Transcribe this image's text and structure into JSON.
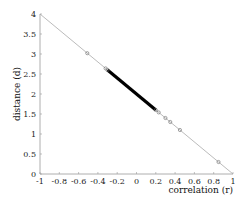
{
  "chart_data": {
    "type": "scatter",
    "title": "",
    "xlabel": "correlation (r)",
    "ylabel": "distance (d)",
    "xlim": [
      -1,
      1
    ],
    "ylim": [
      0,
      4
    ],
    "xticks": [
      "-1",
      "-0.8",
      "-0.6",
      "-0.4",
      "-0.2",
      "0",
      "0.2",
      "0.4",
      "0.6",
      "0.8",
      "1"
    ],
    "yticks": [
      "0",
      "0.5",
      "1",
      "1.5",
      "2",
      "2.5",
      "3",
      "3.5",
      "4"
    ],
    "grid": false,
    "reference_line": {
      "from": [
        -1,
        4
      ],
      "to": [
        1,
        0
      ],
      "color": "#aaaaaa"
    },
    "dense_segment": {
      "r_from": -0.3,
      "r_to": 0.2,
      "color": "#000000"
    },
    "points": [
      {
        "r": -0.51,
        "d": 3.02
      },
      {
        "r": -0.32,
        "d": 2.64
      },
      {
        "r": -0.3,
        "d": 2.6
      },
      {
        "r": 0.2,
        "d": 1.6
      },
      {
        "r": 0.23,
        "d": 1.54
      },
      {
        "r": 0.3,
        "d": 1.4
      },
      {
        "r": 0.35,
        "d": 1.3
      },
      {
        "r": 0.45,
        "d": 1.1
      },
      {
        "r": 0.85,
        "d": 0.3
      }
    ]
  }
}
